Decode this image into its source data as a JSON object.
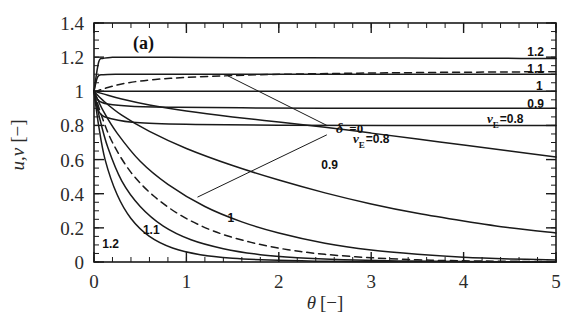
{
  "figure": {
    "panel_tag": "(a)",
    "background": "#ffffff",
    "line_color": "#1a1a1a"
  },
  "chart_data": {
    "type": "line",
    "title": "",
    "panel": "(a)",
    "xlabel": "θ [−]",
    "ylabel": "u,v [−]",
    "xlim": [
      0,
      5
    ],
    "ylim": [
      0,
      1.4
    ],
    "xticks": [
      0,
      1,
      2,
      3,
      4,
      5
    ],
    "xticklabels": [
      "0",
      "1",
      "2",
      "3",
      "4",
      "5"
    ],
    "yticks": [
      0,
      0.2,
      0.4,
      0.6,
      0.8,
      1,
      1.2,
      1.4
    ],
    "yticklabels": [
      "0",
      "0.2",
      "0.4",
      "0.6",
      "0.8",
      "1",
      "1.2",
      "1.4"
    ],
    "x_minor_step": 0.2,
    "y_minor_step": 0.05,
    "grid": false,
    "legend": "inline-curve-labels",
    "tick_direction": "in",
    "series": [
      {
        "name": "u, v_E=1.2",
        "label": "1.2",
        "label_pos": [
          4.78,
          1.205
        ],
        "style": "solid",
        "group": "upper",
        "x": [
          0,
          0.05,
          0.1,
          0.2,
          0.3,
          0.5,
          0.8,
          1.2,
          1.7,
          2.3,
          3.0,
          3.8,
          4.4,
          5.0
        ],
        "y": [
          1.0,
          1.17,
          1.193,
          1.199,
          1.2,
          1.2,
          1.199,
          1.198,
          1.197,
          1.196,
          1.195,
          1.194,
          1.193,
          1.192
        ]
      },
      {
        "name": "u, v_E=1.1 (dashed, delta=0)",
        "label": "",
        "style": "dashed",
        "group": "upper",
        "x": [
          0,
          0.05,
          0.15,
          0.3,
          0.5,
          0.75,
          1.0,
          1.4,
          1.8,
          2.2,
          2.7,
          3.2,
          3.8,
          4.4,
          5.0
        ],
        "y": [
          1.0,
          1.005,
          1.022,
          1.043,
          1.06,
          1.073,
          1.081,
          1.09,
          1.097,
          1.101,
          1.105,
          1.108,
          1.111,
          1.113,
          1.115
        ]
      },
      {
        "name": "u, v_E=1.1",
        "label": "1.1",
        "label_pos": [
          4.78,
          1.105
        ],
        "style": "solid",
        "group": "upper",
        "x": [
          0,
          0.04,
          0.1,
          0.25,
          0.6,
          1.2,
          2.0,
          3.0,
          4.0,
          5.0
        ],
        "y": [
          1.0,
          1.085,
          1.097,
          1.1,
          1.1,
          1.1,
          1.1,
          1.1,
          1.1,
          1.1
        ]
      },
      {
        "name": "u, v_E=1.0",
        "label": "1",
        "label_pos": [
          4.82,
          1.005
        ],
        "style": "solid",
        "group": "upper",
        "x": [
          0,
          1,
          2,
          3,
          4,
          5
        ],
        "y": [
          1.0,
          1.0,
          1.0,
          1.0,
          1.0,
          1.0
        ]
      },
      {
        "name": "u, v_E=0.9",
        "label": "0.9",
        "label_pos": [
          4.78,
          0.905
        ],
        "style": "solid",
        "group": "upper",
        "x": [
          0,
          0.05,
          0.15,
          0.4,
          0.9,
          1.6,
          2.5,
          3.5,
          5.0
        ],
        "y": [
          1.0,
          0.945,
          0.925,
          0.912,
          0.906,
          0.903,
          0.901,
          0.9,
          0.9
        ]
      },
      {
        "name": "u, v_E=0.8 upper-flat",
        "label": "v_E=0.8",
        "label_pos": [
          4.45,
          0.815
        ],
        "style": "solid",
        "group": "upper",
        "x": [
          0,
          0.06,
          0.2,
          0.5,
          1.1,
          2.0,
          3.2,
          5.0
        ],
        "y": [
          1.0,
          0.875,
          0.838,
          0.815,
          0.805,
          0.801,
          0.8,
          0.8
        ]
      },
      {
        "name": "v, v_E=0.8 descending",
        "label": "v_E=0.8",
        "label_pos": [
          3.0,
          0.7
        ],
        "style": "solid",
        "group": "descending",
        "x": [
          0,
          0.1,
          0.3,
          0.6,
          1.0,
          1.5,
          2.0,
          2.5,
          3.0,
          3.5,
          4.0,
          4.5,
          5.0
        ],
        "y": [
          1.0,
          0.985,
          0.955,
          0.92,
          0.885,
          0.85,
          0.82,
          0.79,
          0.755,
          0.72,
          0.685,
          0.65,
          0.615
        ]
      },
      {
        "name": "v, 0.9 descending",
        "label": "0.9",
        "label_pos": [
          2.55,
          0.545
        ],
        "style": "solid",
        "group": "descending",
        "x": [
          0,
          0.1,
          0.3,
          0.6,
          1.0,
          1.5,
          2.0,
          2.5,
          3.0,
          3.5,
          4.0,
          4.5,
          5.0
        ],
        "y": [
          1.0,
          0.945,
          0.86,
          0.765,
          0.665,
          0.565,
          0.48,
          0.405,
          0.34,
          0.285,
          0.24,
          0.2,
          0.17
        ]
      },
      {
        "name": "v, 1 descending",
        "label": "1",
        "label_pos": [
          1.48,
          0.235
        ],
        "style": "solid",
        "group": "descending",
        "x": [
          0,
          0.1,
          0.25,
          0.5,
          0.8,
          1.2,
          1.6,
          2.0,
          2.5,
          3.0,
          3.5,
          4.0,
          4.5,
          5.0
        ],
        "y": [
          1.0,
          0.885,
          0.755,
          0.59,
          0.455,
          0.325,
          0.235,
          0.17,
          0.11,
          0.07,
          0.045,
          0.028,
          0.018,
          0.012
        ]
      },
      {
        "name": "v, delta=0 descending (dashed)",
        "label": "",
        "style": "dashed",
        "group": "descending",
        "x": [
          0,
          0.08,
          0.2,
          0.4,
          0.65,
          0.95,
          1.3,
          1.7,
          2.1,
          2.5,
          3.0,
          3.5,
          4.0,
          5.0
        ],
        "y": [
          1.0,
          0.86,
          0.7,
          0.525,
          0.385,
          0.27,
          0.18,
          0.115,
          0.072,
          0.045,
          0.025,
          0.013,
          0.007,
          0.002
        ]
      },
      {
        "name": "v, 1.1 descending",
        "label": "1.1",
        "label_pos": [
          0.62,
          0.165
        ],
        "style": "solid",
        "group": "descending",
        "x": [
          0,
          0.06,
          0.15,
          0.3,
          0.5,
          0.75,
          1.05,
          1.4,
          1.8,
          2.2,
          2.7,
          3.3,
          4.0,
          5.0
        ],
        "y": [
          1.0,
          0.845,
          0.67,
          0.475,
          0.325,
          0.21,
          0.13,
          0.078,
          0.043,
          0.025,
          0.013,
          0.006,
          0.003,
          0.001
        ]
      },
      {
        "name": "v, 1.2 descending",
        "label": "1.2",
        "label_pos": [
          0.18,
          0.08
        ],
        "style": "solid",
        "group": "descending",
        "x": [
          0,
          0.05,
          0.12,
          0.25,
          0.4,
          0.6,
          0.85,
          1.15,
          1.5,
          1.9,
          2.4,
          3.0,
          4.0,
          5.0
        ],
        "y": [
          1.0,
          0.8,
          0.6,
          0.395,
          0.255,
          0.15,
          0.082,
          0.043,
          0.022,
          0.011,
          0.005,
          0.002,
          0.001,
          0.0
        ]
      }
    ],
    "annotations": [
      {
        "name": "delta-zero",
        "text_delta": "δ",
        "text_eq": "=0",
        "text": "δ =0",
        "pos": [
          2.62,
          0.755
        ],
        "leaders": [
          {
            "from": [
              2.52,
              0.8
            ],
            "to": [
              1.45,
              1.09
            ]
          },
          {
            "from": [
              2.52,
              0.745
            ],
            "to": [
              1.12,
              0.38
            ]
          }
        ]
      }
    ]
  }
}
